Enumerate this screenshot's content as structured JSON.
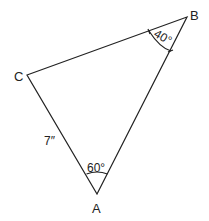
{
  "diagram": {
    "type": "triangle",
    "vertices": {
      "A": {
        "label": "A",
        "x": 97,
        "y": 194
      },
      "B": {
        "label": "B",
        "x": 187,
        "y": 17
      },
      "C": {
        "label": "C",
        "x": 27,
        "y": 75
      }
    },
    "side_labels": {
      "AC": "7″"
    },
    "angle_labels": {
      "A": "60°",
      "B": "40°"
    },
    "stroke_color": "#222222",
    "background": "#ffffff"
  }
}
